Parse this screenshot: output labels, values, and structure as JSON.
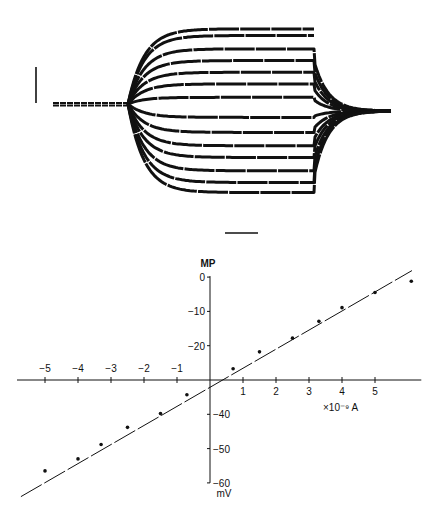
{
  "chart_data": [
    {
      "type": "line",
      "panel": "voltage-traces",
      "title": "",
      "description": "Membrane potential responses to hyperpolarizing and depolarizing current pulses (14 superimposed sweeps) with vertical and horizontal scale bars",
      "scale_bars": {
        "vertical": {
          "label": ""
        },
        "horizontal": {
          "label": ""
        }
      },
      "baseline_level": 0,
      "steady_state_levels": [
        4.5,
        4.1,
        3.3,
        2.6,
        1.9,
        1.2,
        0.4,
        -0.8,
        -1.7,
        -2.5,
        -3.2,
        -4.0,
        -4.7,
        -5.3
      ],
      "tail_to_baseline": [
        false,
        false,
        true,
        true,
        true,
        true,
        true,
        true,
        true,
        true,
        true,
        true,
        true,
        true
      ],
      "units": "relative (scale bar units)"
    },
    {
      "type": "scatter",
      "panel": "current-voltage",
      "title": "",
      "xlabel": "×10⁻⁹ A",
      "ylabel_top": "MP",
      "ylabel_bottom": "mV",
      "xlim": [
        -5.7,
        6.1
      ],
      "ylim": [
        -64,
        2
      ],
      "x_ticks": [
        -5,
        -4,
        -3,
        -2,
        -1,
        1,
        2,
        3,
        4,
        5
      ],
      "x_tick_labels": [
        "−5",
        "−4",
        "−3",
        "−2",
        "−1",
        "1",
        "2",
        "3",
        "4",
        "5"
      ],
      "y_ticks": [
        0,
        -10,
        -20,
        -40,
        -50,
        -60
      ],
      "y_tick_labels": [
        "0",
        "−10",
        "−20",
        "−40",
        "−50",
        "−60"
      ],
      "x_axis_crosses_y_at": -30,
      "grid": false,
      "legend": "none",
      "points": {
        "x": [
          -5.0,
          -4.0,
          -3.3,
          -2.5,
          -1.5,
          -0.7,
          0.7,
          1.5,
          2.5,
          3.3,
          4.0,
          5.0,
          6.1
        ],
        "y": [
          -56.5,
          -53.0,
          -48.8,
          -43.8,
          -39.8,
          -34.3,
          -26.7,
          -21.8,
          -17.8,
          -12.9,
          -8.9,
          -4.5,
          -1.2
        ]
      },
      "fit_line": {
        "x": [
          -5.73,
          6.12
        ],
        "y": [
          -64.0,
          1.9
        ],
        "slope_mV_per_nA": 5.56
      }
    }
  ]
}
